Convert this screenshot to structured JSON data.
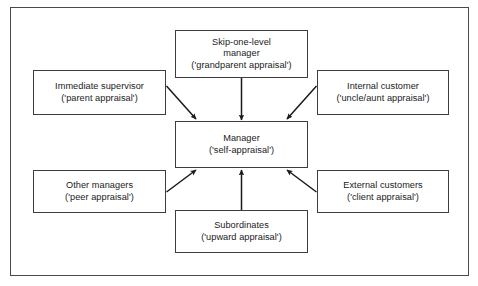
{
  "figure": {
    "border_color": "#4a4a4a",
    "box_border_color": "#3d3d3d",
    "text_color": "#1a1a1a",
    "background": "#ffffff"
  },
  "nodes": {
    "skip_one_level": {
      "line1": "Skip-one-level",
      "line2": "manager",
      "line3": "('grandparent appraisal')"
    },
    "immediate_supervisor": {
      "line1": "Immediate supervisor",
      "line2": "('parent appraisal')"
    },
    "internal_customer": {
      "line1": "Internal customer",
      "line2": "('uncle/aunt appraisal')"
    },
    "manager": {
      "line1": "Manager",
      "line2": "('self-appraisal')"
    },
    "other_managers": {
      "line1": "Other managers",
      "line2": "('peer appraisal')"
    },
    "external_customers": {
      "line1": "External customers",
      "line2": "('client appraisal')"
    },
    "subordinates": {
      "line1": "Subordinates",
      "line2": "('upward appraisal')"
    }
  },
  "connectors": [
    {
      "name": "skip-one-level-to-manager",
      "from": "skip_one_level",
      "to": "manager",
      "direction": "down"
    },
    {
      "name": "immediate-supervisor-to-manager",
      "from": "immediate_supervisor",
      "to": "manager",
      "direction": "down-right"
    },
    {
      "name": "internal-customer-to-manager",
      "from": "internal_customer",
      "to": "manager",
      "direction": "down-left"
    },
    {
      "name": "other-managers-to-manager",
      "from": "other_managers",
      "to": "manager",
      "direction": "up-right"
    },
    {
      "name": "subordinates-to-manager",
      "from": "subordinates",
      "to": "manager",
      "direction": "up"
    },
    {
      "name": "external-customers-to-manager",
      "from": "external_customers",
      "to": "manager",
      "direction": "up-left"
    }
  ]
}
